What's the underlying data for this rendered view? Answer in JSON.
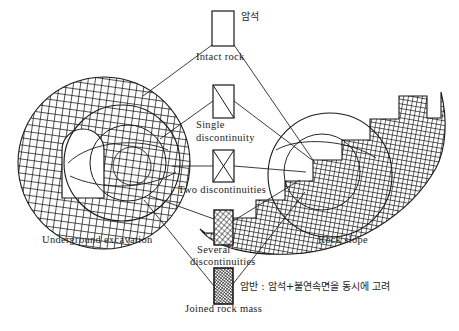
{
  "figure": {
    "title_visible": false,
    "background_color": "#ffffff",
    "line_color": "#1a1a1a",
    "hatch_color": "#1a1a1a"
  },
  "left_object": {
    "name": "Underground excavation",
    "caption": "Underground excavation",
    "description": "circular cross-hatched rock mass with horseshoe shaped tunnel opening and concentric inner circles"
  },
  "right_object": {
    "name": "Rock slope",
    "caption": "Rock slope",
    "description": "stepped benched cross-hatched rock slope with circular failure surface"
  },
  "center_column": {
    "items": [
      {
        "id": "intact-rock",
        "label": "Intact rock",
        "korean_label": "암석",
        "pattern": "empty",
        "box": {
          "x": 212,
          "y": 11,
          "w": 22,
          "h": 35
        }
      },
      {
        "id": "single-discontinuity",
        "label": "Single\ndiscontinuity",
        "label_line1": "Single",
        "label_line2": "discontinuity",
        "korean_label": "",
        "pattern": "one-diagonal",
        "box": {
          "x": 213,
          "y": 85,
          "w": 21,
          "h": 33
        }
      },
      {
        "id": "two-discontinuities",
        "label": "Two discontinuities",
        "korean_label": "",
        "pattern": "crossed-diagonals",
        "box": {
          "x": 213,
          "y": 150,
          "w": 21,
          "h": 32
        }
      },
      {
        "id": "several-discontinuities",
        "label": "Several\ndiscontinuities",
        "label_line1": "Several",
        "label_line2": "discontinuities",
        "korean_label": "",
        "pattern": "coarse-crosshatch",
        "box": {
          "x": 214,
          "y": 210,
          "w": 19,
          "h": 35
        }
      },
      {
        "id": "joined-rock-mass",
        "label": "Joined rock mass",
        "korean_label": "암반 : 암석+불연속면을 동시에 고려",
        "pattern": "dense-crosshatch",
        "box": {
          "x": 214,
          "y": 268,
          "w": 19,
          "h": 36
        }
      }
    ]
  },
  "annotations": {
    "top_korean": "암석",
    "bottom_korean": "암반 : 암석+불연속면을 동시에 고려"
  }
}
